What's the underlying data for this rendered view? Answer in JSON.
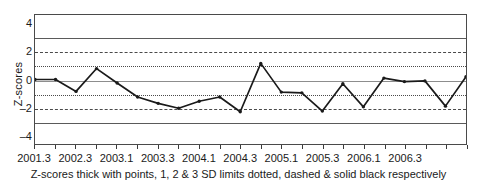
{
  "chart_data": {
    "type": "line",
    "title": "",
    "xlabel": "",
    "ylabel": "Z-scores",
    "ylim": [
      -4.6,
      4.6
    ],
    "yticks": [
      4,
      2,
      0,
      -2,
      -4
    ],
    "ytick_labels": [
      "4",
      "2",
      "0",
      "-2",
      "-4"
    ],
    "grid": false,
    "legend": "none",
    "caption": "Z-scores thick with points, 1, 2 & 3 SD limits dotted, dashed & solid black respectively",
    "x": [
      "2001.3",
      "2001.4",
      "2002.1",
      "2002.2",
      "2002.3",
      "2002.4",
      "2003.1",
      "2003.2",
      "2003.3",
      "2003.4",
      "2004.1",
      "2004.2",
      "2004.3",
      "2004.4",
      "2005.1",
      "2005.2",
      "2005.3",
      "2005.4",
      "2006.1",
      "2006.2",
      "2006.3",
      "2006.4"
    ],
    "xtick_labels": [
      "2001.3",
      "",
      "2002.3",
      "",
      "2003.1",
      "",
      "2003.3",
      "",
      "2004.1",
      "",
      "2004.3",
      "",
      "2005.1",
      "",
      "2005.3",
      "",
      "2006.1",
      "",
      "2006.3",
      ""
    ],
    "xtick_labels_shown": [
      "2001.3",
      "2002.3",
      "2003.1",
      "2003.3",
      "2004.1",
      "2004.3",
      "2005.1",
      "2005.3",
      "2006.1",
      "2006.3"
    ],
    "values": [
      0.0,
      0.0,
      -0.85,
      0.78,
      -0.25,
      -1.25,
      -1.7,
      -2.05,
      -1.55,
      -1.25,
      -2.3,
      1.15,
      -0.9,
      -0.95,
      -2.25,
      -0.3,
      -1.95,
      0.1,
      -0.15,
      -0.1,
      -1.9,
      0.2
    ],
    "reference_lines": [
      {
        "value": 3,
        "style": "solid",
        "label": "+3 SD"
      },
      {
        "value": -3,
        "style": "solid",
        "label": "-3 SD"
      },
      {
        "value": 2,
        "style": "dashed",
        "label": "+2 SD"
      },
      {
        "value": -2,
        "style": "dashed",
        "label": "-2 SD"
      },
      {
        "value": 1,
        "style": "dotted",
        "label": "+1 SD"
      },
      {
        "value": -1,
        "style": "dotted",
        "label": "-1 SD"
      },
      {
        "value": 0,
        "style": "zero",
        "label": "mean"
      }
    ],
    "series_color": "#1a1a1a",
    "marker": "dot"
  }
}
